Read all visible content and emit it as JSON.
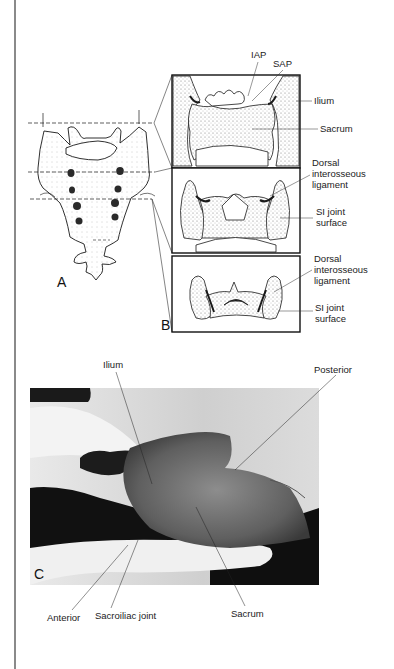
{
  "figure": {
    "panels": {
      "A": {
        "letter": "A"
      },
      "B": {
        "letter": "B",
        "labels": {
          "iap": "IAP",
          "sap": "SAP",
          "ilium": "Ilium",
          "sacrum": "Sacrum",
          "dorsal_ligament_1": "Dorsal\ninterosseous\nligament",
          "si_joint_1": "SI joint\nsurface",
          "dorsal_ligament_2": "Dorsal\ninterosseous\nligament",
          "si_joint_2": "SI joint\nsurface"
        }
      },
      "C": {
        "letter": "C",
        "labels": {
          "ilium": "Ilium",
          "posterior": "Posterior",
          "anterior": "Anterior",
          "sacroiliac_joint": "Sacroiliac joint",
          "sacrum": "Sacrum"
        }
      }
    },
    "colors": {
      "ink": "#1a1a1a",
      "stipple": "#9a9a9a",
      "page": "#ffffff",
      "rule": "#8a8a8a"
    }
  }
}
